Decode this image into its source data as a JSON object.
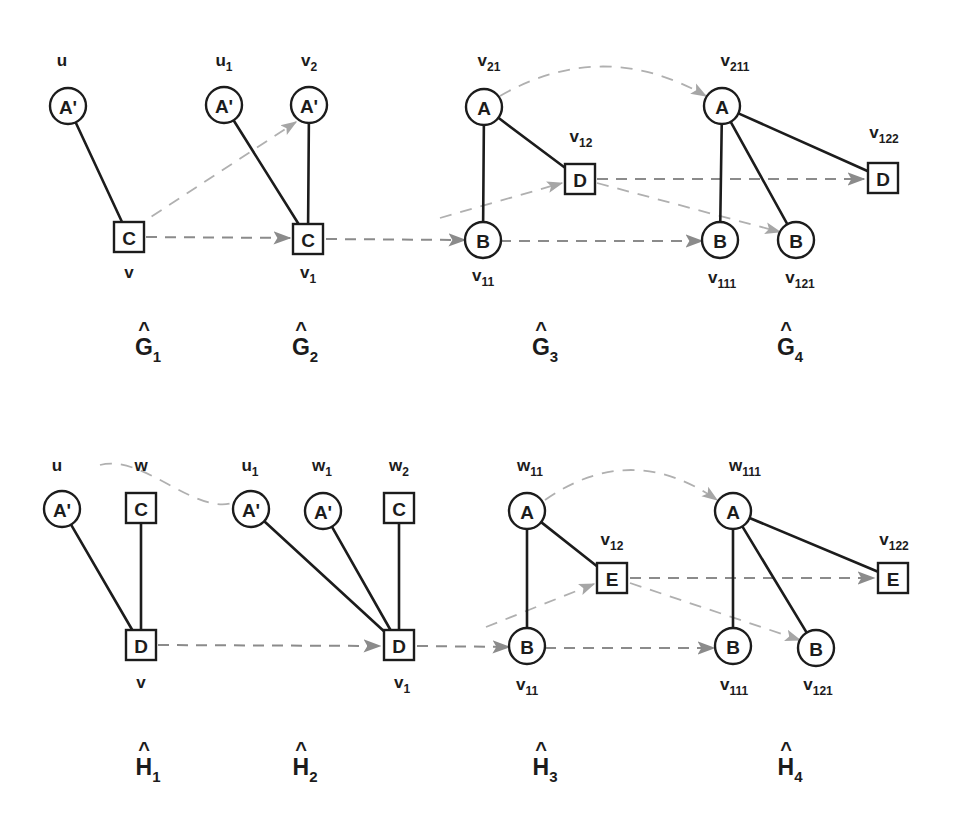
{
  "figure": {
    "colors": {
      "ink": "#1c1c1c",
      "dashed_arrow": "#8b8b8b",
      "dashed_faint": "#b0b0b0",
      "background": "#ffffff"
    }
  },
  "rows": [
    {
      "name": "G-row",
      "panels": [
        {
          "caption": {
            "hat": "^",
            "base": "G",
            "sub": "1"
          },
          "caption_x": 148,
          "caption_y": 355,
          "nodes": [
            {
              "id": "g1-u",
              "shape": "circle",
              "letter": "A'",
              "x": 68,
              "y": 106,
              "label": "u",
              "label_sub": "",
              "label_pos": "above",
              "label_x": 62,
              "label_y": 66
            },
            {
              "id": "g1-v",
              "shape": "square",
              "letter": "C",
              "x": 129,
              "y": 237,
              "label": "v",
              "label_sub": "",
              "label_pos": "below",
              "label_x": 129,
              "label_y": 278
            }
          ],
          "edges": [
            {
              "from": "g1-u",
              "to": "g1-v",
              "style": "solid"
            }
          ]
        },
        {
          "caption": {
            "hat": "^",
            "base": "G",
            "sub": "2"
          },
          "caption_x": 305,
          "caption_y": 355,
          "nodes": [
            {
              "id": "g2-u1",
              "shape": "circle",
              "letter": "A'",
              "x": 224,
              "y": 105,
              "label": "u",
              "label_sub": "1",
              "label_pos": "above",
              "label_x": 224,
              "label_y": 66
            },
            {
              "id": "g2-v2",
              "shape": "circle",
              "letter": "A'",
              "x": 309,
              "y": 105,
              "label": "v",
              "label_sub": "2",
              "label_pos": "above",
              "label_x": 309,
              "label_y": 66
            },
            {
              "id": "g2-v1",
              "shape": "square",
              "letter": "C",
              "x": 308,
              "y": 239,
              "label": "v",
              "label_sub": "1",
              "label_pos": "below",
              "label_x": 308,
              "label_y": 278
            }
          ],
          "edges": [
            {
              "from": "g2-u1",
              "to": "g2-v1",
              "style": "solid"
            },
            {
              "from": "g2-v2",
              "to": "g2-v1",
              "style": "solid"
            }
          ]
        },
        {
          "caption": {
            "hat": "^",
            "base": "G",
            "sub": "3"
          },
          "caption_x": 545,
          "caption_y": 355,
          "nodes": [
            {
              "id": "g3-v21",
              "shape": "circle",
              "letter": "A",
              "x": 484,
              "y": 107,
              "label": "v",
              "label_sub": "21",
              "label_pos": "above",
              "label_x": 489,
              "label_y": 66
            },
            {
              "id": "g3-v11",
              "shape": "circle",
              "letter": "B",
              "x": 483,
              "y": 240,
              "label": "v",
              "label_sub": "11",
              "label_pos": "below",
              "label_x": 483,
              "label_y": 281
            },
            {
              "id": "g3-v12",
              "shape": "square",
              "letter": "D",
              "x": 580,
              "y": 179,
              "label": "v",
              "label_sub": "12",
              "label_pos": "above",
              "label_x": 581,
              "label_y": 142
            }
          ],
          "edges": [
            {
              "from": "g3-v21",
              "to": "g3-v11",
              "style": "solid"
            },
            {
              "from": "g3-v21",
              "to": "g3-v12",
              "style": "solid"
            }
          ]
        },
        {
          "caption": {
            "hat": "^",
            "base": "G",
            "sub": "4"
          },
          "caption_x": 790,
          "caption_y": 355,
          "nodes": [
            {
              "id": "g4-v211",
              "shape": "circle",
              "letter": "A",
              "x": 722,
              "y": 106,
              "label": "v",
              "label_sub": "211",
              "label_pos": "above",
              "label_x": 735,
              "label_y": 66
            },
            {
              "id": "g4-v111",
              "shape": "circle",
              "letter": "B",
              "x": 720,
              "y": 240,
              "label": "v",
              "label_sub": "111",
              "label_pos": "below",
              "label_x": 722,
              "label_y": 283
            },
            {
              "id": "g4-v121",
              "shape": "circle",
              "letter": "B",
              "x": 796,
              "y": 240,
              "label": "v",
              "label_sub": "121",
              "label_pos": "below",
              "label_x": 800,
              "label_y": 283
            },
            {
              "id": "g4-v122",
              "shape": "square",
              "letter": "D",
              "x": 883,
              "y": 178,
              "label": "v",
              "label_sub": "122",
              "label_pos": "above",
              "label_x": 884,
              "label_y": 138
            }
          ],
          "edges": [
            {
              "from": "g4-v211",
              "to": "g4-v111",
              "style": "solid"
            },
            {
              "from": "g4-v211",
              "to": "g4-v121",
              "style": "solid"
            },
            {
              "from": "g4-v211",
              "to": "g4-v122",
              "style": "solid"
            }
          ]
        }
      ],
      "mappings": [
        {
          "kind": "straight",
          "from": [
            146,
            237
          ],
          "to": [
            290,
            238
          ]
        },
        {
          "kind": "straight",
          "from": [
            326,
            239
          ],
          "to": [
            465,
            240
          ]
        },
        {
          "kind": "straight",
          "from": [
            500,
            241
          ],
          "to": [
            702,
            241
          ]
        },
        {
          "kind": "straight",
          "from": [
            597,
            179
          ],
          "to": [
            864,
            179
          ]
        },
        {
          "kind": "diagonal",
          "from": [
            134,
            228
          ],
          "to": [
            296,
            122
          ]
        },
        {
          "kind": "diagonal",
          "from": [
            440,
            218
          ],
          "to": [
            562,
            183
          ]
        },
        {
          "kind": "diagonal",
          "from": [
            597,
            183
          ],
          "to": [
            780,
            232
          ]
        },
        {
          "kind": "arc",
          "from": [
            500,
            96
          ],
          "to": [
            706,
            96
          ],
          "peak_y": 55
        }
      ]
    },
    {
      "name": "H-row",
      "panels": [
        {
          "caption": {
            "hat": "^",
            "base": "H",
            "sub": "1"
          },
          "caption_x": 148,
          "caption_y": 775,
          "nodes": [
            {
              "id": "h1-u",
              "shape": "circle",
              "letter": "A'",
              "x": 62,
              "y": 509,
              "label": "u",
              "label_sub": "",
              "label_pos": "above",
              "label_x": 57,
              "label_y": 471
            },
            {
              "id": "h1-w",
              "shape": "square",
              "letter": "C",
              "x": 141,
              "y": 508,
              "label": "w",
              "label_sub": "",
              "label_pos": "above",
              "label_x": 141,
              "label_y": 471
            },
            {
              "id": "h1-v",
              "shape": "square",
              "letter": "D",
              "x": 141,
              "y": 645,
              "label": "v",
              "label_sub": "",
              "label_pos": "below",
              "label_x": 141,
              "label_y": 688
            }
          ],
          "edges": [
            {
              "from": "h1-u",
              "to": "h1-v",
              "style": "solid"
            },
            {
              "from": "h1-w",
              "to": "h1-v",
              "style": "solid"
            }
          ]
        },
        {
          "caption": {
            "hat": "^",
            "base": "H",
            "sub": "2"
          },
          "caption_x": 305,
          "caption_y": 775,
          "nodes": [
            {
              "id": "h2-u1",
              "shape": "circle",
              "letter": "A'",
              "x": 251,
              "y": 509,
              "label": "u",
              "label_sub": "1",
              "label_pos": "above",
              "label_x": 250,
              "label_y": 471
            },
            {
              "id": "h2-w1",
              "shape": "circle",
              "letter": "A'",
              "x": 323,
              "y": 511,
              "label": "w",
              "label_sub": "1",
              "label_pos": "above",
              "label_x": 322,
              "label_y": 471
            },
            {
              "id": "h2-w2",
              "shape": "square",
              "letter": "C",
              "x": 399,
              "y": 508,
              "label": "w",
              "label_sub": "2",
              "label_pos": "above",
              "label_x": 399,
              "label_y": 471
            },
            {
              "id": "h2-v1",
              "shape": "square",
              "letter": "D",
              "x": 399,
              "y": 645,
              "label": "v",
              "label_sub": "1",
              "label_pos": "below",
              "label_x": 402,
              "label_y": 688
            }
          ],
          "edges": [
            {
              "from": "h2-u1",
              "to": "h2-v1",
              "style": "solid"
            },
            {
              "from": "h2-w1",
              "to": "h2-v1",
              "style": "solid"
            },
            {
              "from": "h2-w2",
              "to": "h2-v1",
              "style": "solid"
            }
          ]
        },
        {
          "caption": {
            "hat": "^",
            "base": "H",
            "sub": "3"
          },
          "caption_x": 545,
          "caption_y": 775,
          "nodes": [
            {
              "id": "h3-w11",
              "shape": "circle",
              "letter": "A",
              "x": 527,
              "y": 511,
              "label": "w",
              "label_sub": "11",
              "label_pos": "above",
              "label_x": 530,
              "label_y": 471
            },
            {
              "id": "h3-v11",
              "shape": "circle",
              "letter": "B",
              "x": 527,
              "y": 646,
              "label": "v",
              "label_sub": "11",
              "label_pos": "below",
              "label_x": 527,
              "label_y": 690
            },
            {
              "id": "h3-v12",
              "shape": "square",
              "letter": "E",
              "x": 612,
              "y": 578,
              "label": "v",
              "label_sub": "12",
              "label_pos": "above",
              "label_x": 612,
              "label_y": 545
            }
          ],
          "edges": [
            {
              "from": "h3-w11",
              "to": "h3-v11",
              "style": "solid"
            },
            {
              "from": "h3-w11",
              "to": "h3-v12",
              "style": "solid"
            }
          ]
        },
        {
          "caption": {
            "hat": "^",
            "base": "H",
            "sub": "4"
          },
          "caption_x": 790,
          "caption_y": 775,
          "nodes": [
            {
              "id": "h4-w111",
              "shape": "circle",
              "letter": "A",
              "x": 733,
              "y": 511,
              "label": "w",
              "label_sub": "111",
              "label_pos": "above",
              "label_x": 745,
              "label_y": 471
            },
            {
              "id": "h4-v111",
              "shape": "circle",
              "letter": "B",
              "x": 733,
              "y": 646,
              "label": "v",
              "label_sub": "111",
              "label_pos": "below",
              "label_x": 734,
              "label_y": 690
            },
            {
              "id": "h4-v121",
              "shape": "circle",
              "letter": "B",
              "x": 816,
              "y": 648,
              "label": "v",
              "label_sub": "121",
              "label_pos": "below",
              "label_x": 818,
              "label_y": 690
            },
            {
              "id": "h4-v122",
              "shape": "square",
              "letter": "E",
              "x": 893,
              "y": 578,
              "label": "v",
              "label_sub": "122",
              "label_pos": "above",
              "label_x": 894,
              "label_y": 545
            }
          ],
          "edges": [
            {
              "from": "h4-w111",
              "to": "h4-v111",
              "style": "solid"
            },
            {
              "from": "h4-w111",
              "to": "h4-v121",
              "style": "solid"
            },
            {
              "from": "h4-w111",
              "to": "h4-v122",
              "style": "solid"
            }
          ]
        }
      ],
      "mappings": [
        {
          "kind": "straight",
          "from": [
            158,
            645
          ],
          "to": [
            380,
            646
          ]
        },
        {
          "kind": "straight",
          "from": [
            417,
            646
          ],
          "to": [
            509,
            647
          ]
        },
        {
          "kind": "straight",
          "from": [
            545,
            648
          ],
          "to": [
            714,
            648
          ]
        },
        {
          "kind": "straight",
          "from": [
            630,
            578
          ],
          "to": [
            874,
            578
          ]
        },
        {
          "kind": "diagonal",
          "from": [
            486,
            627
          ],
          "to": [
            594,
            584
          ]
        },
        {
          "kind": "diagonal",
          "from": [
            630,
            583
          ],
          "to": [
            800,
            640
          ]
        },
        {
          "kind": "arc",
          "from": [
            545,
            500
          ],
          "to": [
            717,
            500
          ],
          "peak_y": 458
        },
        {
          "kind": "wave",
          "from": [
            100,
            465
          ],
          "to": [
            240,
            500
          ]
        }
      ]
    }
  ]
}
